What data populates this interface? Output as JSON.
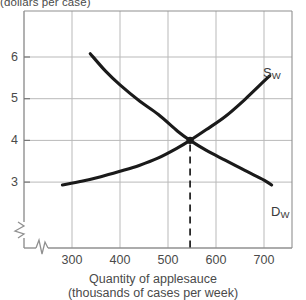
{
  "chart_data": {
    "type": "line",
    "title": "",
    "ylabel": "(dollars per case)",
    "xlabel_line1": "Quantity of applesauce",
    "xlabel_line2": "(thousands of cases per week)",
    "xlim": [
      240,
      760
    ],
    "ylim": [
      2.45,
      6.6
    ],
    "xticks": [
      300,
      400,
      500,
      600,
      700
    ],
    "xtick_labels": [
      "300",
      "400",
      "500",
      "600",
      "700"
    ],
    "yticks": [
      3,
      4,
      5,
      6
    ],
    "ytick_labels": [
      "3",
      "4",
      "5",
      "6"
    ],
    "grid": true,
    "axis_break_x": true,
    "axis_break_y": true,
    "legend_position": "inline-curve-end",
    "series": [
      {
        "name": "S_W",
        "label_text": "S",
        "label_subscript": "W",
        "role": "supply",
        "color": "#1a1a1a",
        "points": [
          [
            280,
            2.93
          ],
          [
            320,
            3.02
          ],
          [
            360,
            3.13
          ],
          [
            400,
            3.26
          ],
          [
            440,
            3.4
          ],
          [
            480,
            3.58
          ],
          [
            520,
            3.82
          ],
          [
            546,
            4.0
          ],
          [
            580,
            4.26
          ],
          [
            620,
            4.58
          ],
          [
            660,
            4.98
          ],
          [
            700,
            5.42
          ],
          [
            712,
            5.55
          ]
        ]
      },
      {
        "name": "D_W",
        "label_text": "D",
        "label_subscript": "W",
        "role": "demand",
        "color": "#1a1a1a",
        "points": [
          [
            338,
            6.08
          ],
          [
            370,
            5.66
          ],
          [
            400,
            5.33
          ],
          [
            440,
            4.95
          ],
          [
            480,
            4.62
          ],
          [
            520,
            4.22
          ],
          [
            546,
            4.0
          ],
          [
            580,
            3.76
          ],
          [
            620,
            3.52
          ],
          [
            660,
            3.28
          ],
          [
            700,
            3.05
          ],
          [
            716,
            2.93
          ]
        ]
      }
    ],
    "equilibrium": {
      "quantity": 546,
      "price": 4.0,
      "marker": "filled-dot",
      "dropline": "dashed-vertical"
    },
    "annotations": [
      {
        "name": "supply-curve-label",
        "text": "S",
        "subscript": "W",
        "x": 263,
        "y": 66
      },
      {
        "name": "demand-curve-label",
        "text": "D",
        "subscript": "W",
        "x": 271,
        "y": 205
      }
    ]
  },
  "colors": {
    "curve": "#1a1a1a",
    "grid": "#b5b5b5",
    "frame": "#8e8e8e",
    "text": "#4a4a4a",
    "background": "#ffffff"
  }
}
